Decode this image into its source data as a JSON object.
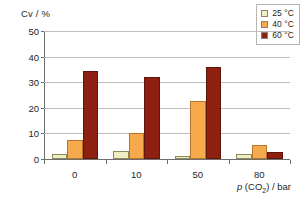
{
  "chart_data": {
    "type": "bar",
    "title": "",
    "subtitle": "",
    "xlabel": "p (CO2) / bar",
    "ylabel": "Cv / %",
    "categories": [
      "0",
      "10",
      "50",
      "80"
    ],
    "ylim": [
      0,
      50
    ],
    "yticks": [
      0,
      10,
      20,
      30,
      40,
      50
    ],
    "grid": "horizontal",
    "legend_position": "top-right",
    "series": [
      {
        "name": "25 °C",
        "color": "#eeeec2",
        "border_color": "#8f8a5e",
        "values": [
          2.0,
          3.0,
          1.0,
          2.0
        ]
      },
      {
        "name": "40 °C",
        "color": "#f6a94d",
        "border_color": "#b5752a",
        "values": [
          7.3,
          10.2,
          22.8,
          5.3
        ]
      },
      {
        "name": "60 °C",
        "color": "#8d2010",
        "border_color": "#5e150a",
        "values": [
          34.3,
          32.0,
          36.0,
          2.6
        ]
      }
    ]
  },
  "axes": {
    "y_title": "Cv / %",
    "y_tick_labels": [
      "0",
      "10",
      "20",
      "30",
      "40",
      "50"
    ],
    "x_tick_labels": [
      "0",
      "10",
      "50",
      "80"
    ],
    "x_title_prefix": "p",
    "x_title_paren_open": " (CO",
    "x_title_sub": "2",
    "x_title_suffix": ") / bar"
  },
  "legend": {
    "entries": [
      {
        "label": "25 °C",
        "color": "#eeeec2"
      },
      {
        "label": "40 °C",
        "color": "#f6a94d"
      },
      {
        "label": "60 °C",
        "color": "#8d2010"
      }
    ]
  },
  "colors": {
    "gridline": "#bdbdbd",
    "axis": "#6e6e6e",
    "text": "#231f1e",
    "background": "#ffffff",
    "legend_border": "#b9b4ae"
  }
}
